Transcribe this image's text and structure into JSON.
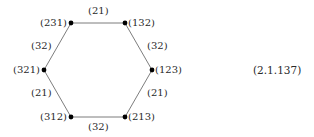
{
  "diagram": {
    "type": "hexagon-graph",
    "nodes": [
      {
        "id": "231",
        "label": "(231)",
        "x": 71,
        "y": 23
      },
      {
        "id": "132",
        "label": "(132)",
        "x": 125,
        "y": 23
      },
      {
        "id": "321",
        "label": "(321)",
        "x": 44,
        "y": 70
      },
      {
        "id": "123",
        "label": "(123)",
        "x": 152,
        "y": 70
      },
      {
        "id": "312",
        "label": "(312)",
        "x": 71,
        "y": 117
      },
      {
        "id": "213",
        "label": "(213)",
        "x": 125,
        "y": 117
      }
    ],
    "edges": [
      {
        "from": "231",
        "to": "132",
        "label": "(21)"
      },
      {
        "from": "231",
        "to": "321",
        "label": "(32)"
      },
      {
        "from": "132",
        "to": "123",
        "label": "(32)"
      },
      {
        "from": "321",
        "to": "312",
        "label": "(21)"
      },
      {
        "from": "123",
        "to": "213",
        "label": "(21)"
      },
      {
        "from": "312",
        "to": "213",
        "label": "(32)"
      }
    ],
    "equation_number": "(2.1.137)",
    "colors": {
      "edge": "#6e6e6e",
      "node": "#000000",
      "text": "#2a2a2a",
      "background": "#ffffff"
    }
  }
}
